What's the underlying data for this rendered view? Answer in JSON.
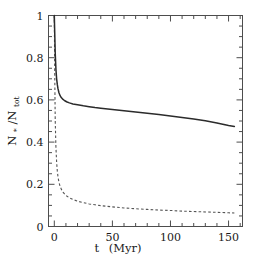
{
  "figure": {
    "background_color": "#ffffff",
    "frame_color": "#4d4d4d"
  },
  "axes": {
    "x": {
      "label_main": "t",
      "label_units": "(Myr)",
      "ticks": [
        "0",
        "50",
        "100",
        "150"
      ],
      "tick_values": [
        0,
        50,
        100,
        150
      ],
      "range": [
        -5,
        162
      ],
      "minor_tick_step": 10
    },
    "y": {
      "label_main": "N",
      "label_sub1": "*",
      "label_sep": "/N",
      "label_sub2": "tot",
      "ticks": [
        "0",
        "0.2",
        "0.4",
        "0.6",
        "0.8",
        "1"
      ],
      "tick_values": [
        0,
        0.2,
        0.4,
        0.6,
        0.8,
        1
      ],
      "range": [
        0,
        1
      ],
      "minor_tick_step": 0.05
    }
  },
  "chart_data": {
    "type": "line",
    "title": "",
    "xlabel": "t  (Myr)",
    "ylabel": "N*/Ntot",
    "xlim": [
      -5,
      162
    ],
    "ylim": [
      0,
      1
    ],
    "grid": false,
    "legend_position": "none",
    "series": [
      {
        "name": "solid-curve",
        "style": "solid",
        "color": "#2b2b2b",
        "x": [
          0,
          0.3,
          0.8,
          1.4,
          2.0,
          2.6,
          3.2,
          4.0,
          5.0,
          6.0,
          7.5,
          9.0,
          11.0,
          13.0,
          16.0,
          20.0,
          25.0,
          30.0,
          35.0,
          40.0,
          50.0,
          60.0,
          70.0,
          80.0,
          90.0,
          100.0,
          110.0,
          120.0,
          130.0,
          140.0,
          150.0,
          155.0
        ],
        "y": [
          1.0,
          0.93,
          0.82,
          0.745,
          0.7,
          0.672,
          0.652,
          0.634,
          0.62,
          0.611,
          0.602,
          0.596,
          0.59,
          0.586,
          0.581,
          0.577,
          0.572,
          0.568,
          0.564,
          0.561,
          0.555,
          0.549,
          0.543,
          0.537,
          0.531,
          0.524,
          0.517,
          0.509,
          0.501,
          0.491,
          0.479,
          0.474
        ]
      },
      {
        "name": "dashed-curve",
        "style": "dashed",
        "color": "#555555",
        "x": [
          0,
          0.3,
          0.8,
          1.4,
          2.0,
          2.6,
          3.2,
          4.0,
          5.0,
          6.0,
          7.5,
          9.0,
          11.0,
          13.0,
          16.0,
          20.0,
          25.0,
          30.0,
          35.0,
          40.0,
          50.0,
          60.0,
          70.0,
          80.0,
          90.0,
          100.0,
          110.0,
          120.0,
          130.0,
          140.0,
          150.0,
          155.0
        ],
        "y": [
          1.0,
          0.76,
          0.5,
          0.375,
          0.305,
          0.262,
          0.234,
          0.21,
          0.19,
          0.177,
          0.163,
          0.153,
          0.143,
          0.136,
          0.128,
          0.12,
          0.113,
          0.107,
          0.103,
          0.099,
          0.093,
          0.088,
          0.084,
          0.081,
          0.078,
          0.076,
          0.073,
          0.071,
          0.069,
          0.067,
          0.065,
          0.064
        ]
      }
    ]
  }
}
